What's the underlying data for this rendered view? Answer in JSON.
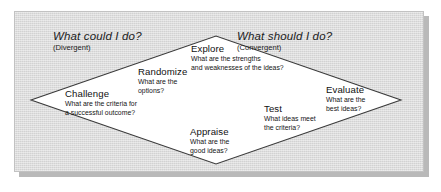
{
  "diagram": {
    "background_color": "#d9d9d9",
    "diamond_fill": "#ffffff",
    "diamond_stroke": "#3a3a3a",
    "corner_questions": [
      {
        "id": "divergent",
        "title": "What could I do?",
        "subtitle": "(Divergent)"
      },
      {
        "id": "convergent",
        "title": "What should I do?",
        "subtitle": "(Convergent)"
      }
    ],
    "nodes": [
      {
        "id": "explore",
        "title": "Explore",
        "desc_line1": "What are the strengths",
        "desc_line2": "and weaknesses of the ideas?"
      },
      {
        "id": "randomize",
        "title": "Randomize",
        "desc_line1": "What are the",
        "desc_line2": "options?"
      },
      {
        "id": "challenge",
        "title": "Challenge",
        "desc_line1": "What are the criteria for",
        "desc_line2": "a successful outcome?"
      },
      {
        "id": "appraise",
        "title": "Appraise",
        "desc_line1": "What are the",
        "desc_line2": "good ideas?"
      },
      {
        "id": "test",
        "title": "Test",
        "desc_line1": "What ideas meet",
        "desc_line2": "the criteria?"
      },
      {
        "id": "evaluate",
        "title": "Evaluate",
        "desc_line1": "What are the",
        "desc_line2": "best ideas?"
      }
    ]
  }
}
